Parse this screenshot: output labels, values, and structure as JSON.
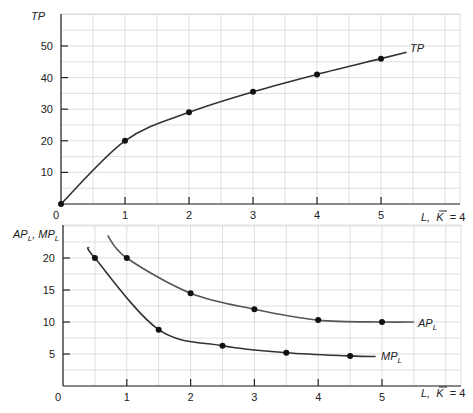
{
  "chart_data": [
    {
      "type": "line",
      "title": "",
      "ylabel": "TP",
      "xlabel": "L, K̄ = 4",
      "xlim": [
        0,
        5.5
      ],
      "ylim": [
        0,
        55
      ],
      "x_ticks": [
        "0",
        "1",
        "2",
        "3",
        "4",
        "5"
      ],
      "y_ticks": [
        "10",
        "20",
        "30",
        "40",
        "50"
      ],
      "grid": true,
      "series": [
        {
          "name": "TP",
          "x": [
            0,
            1,
            2,
            3,
            4,
            5
          ],
          "values": [
            0,
            20,
            29,
            35.5,
            41,
            46
          ],
          "curve_extends_to": [
            5.4,
            48
          ],
          "label_position": "right-end"
        }
      ]
    },
    {
      "type": "line",
      "title": "",
      "ylabel": "APL, MPL",
      "xlabel": "L, K̄ = 4",
      "xlim": [
        0,
        5.5
      ],
      "ylim": [
        0,
        25
      ],
      "x_ticks": [
        "0",
        "1",
        "2",
        "3",
        "4",
        "5"
      ],
      "y_ticks": [
        "5",
        "10",
        "15",
        "20"
      ],
      "grid": true,
      "series": [
        {
          "name": "APL",
          "x": [
            1,
            2,
            3,
            4,
            5
          ],
          "values": [
            20,
            14.5,
            12,
            10.3,
            10
          ],
          "curve_extends": {
            "start": [
              0.7,
              23.5
            ],
            "end": [
              5.5,
              10
            ]
          },
          "label_position": "right-end"
        },
        {
          "name": "MPL",
          "x": [
            0.5,
            1.5,
            2.5,
            3.5,
            4.5
          ],
          "values": [
            20,
            8.8,
            6.3,
            5.2,
            4.7
          ],
          "curve_extends": {
            "start": [
              0.4,
              21.7
            ],
            "end": [
              4.9,
              4.6
            ]
          },
          "label_position": "right-end"
        }
      ]
    }
  ],
  "labels": {
    "top_ylabel": "TP",
    "top_curve": "TP",
    "top_xlabel_L": "L,",
    "top_xlabel_K": "K",
    "top_xlabel_eq": "= 4",
    "bottom_ylabel_ap": "AP",
    "bottom_ylabel_sub1": "L",
    "bottom_ylabel_sep": ", MP",
    "bottom_ylabel_sub2": "L",
    "ap_curve": "AP",
    "ap_sub": "L",
    "mp_curve": "MP",
    "mp_sub": "L",
    "bottom_xlabel_L": "L,",
    "bottom_xlabel_K": "K",
    "bottom_xlabel_eq": "= 4",
    "origin": "0",
    "x_ticks": [
      "1",
      "2",
      "3",
      "4",
      "5"
    ],
    "top_y_ticks": [
      "10",
      "20",
      "30",
      "40",
      "50"
    ],
    "bottom_y_ticks": [
      "5",
      "10",
      "15",
      "20"
    ]
  }
}
